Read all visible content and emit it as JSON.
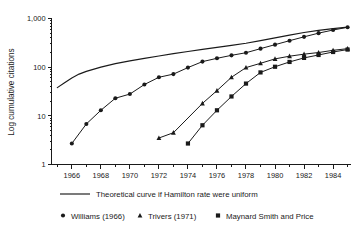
{
  "chart_data": {
    "type": "line",
    "title": "",
    "xlabel": "",
    "ylabel": "Log cumulative citations",
    "yscale": "log",
    "ylim": [
      1,
      1000
    ],
    "xlim": [
      1964.6,
      1985.2
    ],
    "grid": false,
    "y_tick_labels": [
      "1,000",
      "100",
      "10",
      "1"
    ],
    "y_tick_values": [
      1000,
      100,
      10,
      1
    ],
    "x_tick_labels": [
      "1966",
      "1968",
      "1970",
      "1972",
      "1974",
      "1976",
      "1978",
      "1980",
      "1982",
      "1984"
    ],
    "x_tick_values": [
      1966,
      1968,
      1970,
      1972,
      1974,
      1976,
      1978,
      1980,
      1982,
      1984
    ],
    "x_minor_ticks": [
      1965,
      1967,
      1969,
      1971,
      1973,
      1975,
      1977,
      1979,
      1981,
      1983,
      1985
    ],
    "legend_position": "below",
    "series": [
      {
        "name": "Theoretical curve if Hamilton rate were uniform",
        "marker": "none",
        "x": [
          1965.0,
          1965.5,
          1966.0,
          1966.5,
          1967.0,
          1968.0,
          1969.0,
          1970.0,
          1971.0,
          1972.0,
          1973.0,
          1974.0,
          1975.0,
          1976.0,
          1977.0,
          1978.0,
          1979.0,
          1980.0,
          1981.0,
          1982.0,
          1983.0,
          1984.0,
          1985.0
        ],
        "y": [
          38,
          48,
          60,
          72,
          82,
          100,
          118,
          135,
          152,
          170,
          190,
          210,
          232,
          255,
          280,
          310,
          350,
          400,
          455,
          515,
          570,
          620,
          665
        ]
      },
      {
        "name": "Williams (1966)",
        "marker": "circle",
        "x": [
          1966,
          1967,
          1968,
          1969,
          1970,
          1971,
          1972,
          1973,
          1974,
          1975,
          1976,
          1977,
          1978,
          1979,
          1980,
          1981,
          1982,
          1983,
          1984,
          1985
        ],
        "y": [
          2.7,
          6.8,
          13,
          23,
          28,
          44,
          62,
          72,
          98,
          130,
          152,
          175,
          198,
          240,
          290,
          350,
          420,
          500,
          580,
          660
        ]
      },
      {
        "name": "Trivers (1971)",
        "marker": "triangle",
        "x": [
          1972,
          1973,
          1975,
          1976,
          1977,
          1978,
          1979,
          1980,
          1981,
          1982,
          1983,
          1984,
          1985
        ],
        "y": [
          3.5,
          4.5,
          18,
          33,
          62,
          98,
          120,
          148,
          168,
          185,
          200,
          222,
          240
        ]
      },
      {
        "name": "Maynard Smith and Price",
        "marker": "square",
        "x": [
          1974,
          1975,
          1976,
          1977,
          1978,
          1979,
          1980,
          1981,
          1982,
          1983,
          1984,
          1985
        ],
        "y": [
          2.7,
          6.4,
          13,
          25,
          46,
          78,
          102,
          128,
          155,
          178,
          205,
          230
        ]
      }
    ]
  },
  "legend": {
    "theory": {
      "label": "Theoretical curve if Hamilton rate were uniform",
      "marker": "line"
    },
    "entries": [
      {
        "label": "Williams (1966)",
        "marker": "circle"
      },
      {
        "label": "Trivers (1971)",
        "marker": "triangle"
      },
      {
        "label": "Maynard Smith and Price",
        "marker": "square"
      }
    ]
  },
  "colors": {
    "ink": "#1a1a1a",
    "background": "#ffffff"
  }
}
